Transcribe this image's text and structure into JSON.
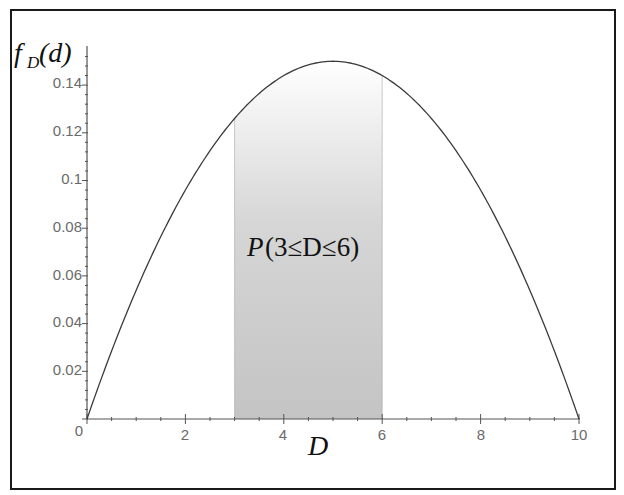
{
  "chart_data": {
    "type": "line",
    "title": "",
    "function": "f_D(d) = 0.006 d (10 - d)",
    "xlabel": "D",
    "ylabel": "f_D(d)",
    "xlim": [
      0,
      10
    ],
    "ylim": [
      0,
      0.15
    ],
    "grid": false,
    "legend": null,
    "x_ticks": [
      0,
      2,
      4,
      6,
      8,
      10
    ],
    "x_tick_labels": [
      "0",
      "2",
      "4",
      "6",
      "8",
      "10"
    ],
    "y_ticks": [
      0,
      0.02,
      0.04,
      0.06,
      0.08,
      0.1,
      0.12,
      0.14
    ],
    "y_tick_labels": [
      "0",
      "0.02",
      "0.04",
      "0.06",
      "0.08",
      "0.1",
      "0.12",
      "0.14"
    ],
    "series": [
      {
        "name": "f_D(d)",
        "x": [
          0,
          1,
          2,
          3,
          4,
          5,
          6,
          7,
          8,
          9,
          10
        ],
        "values": [
          0,
          0.054,
          0.096,
          0.126,
          0.144,
          0.15,
          0.144,
          0.126,
          0.096,
          0.054,
          0
        ]
      }
    ],
    "shaded_region": {
      "from": 3,
      "to": 6,
      "fill": "gradient white-to-grey"
    },
    "annotations": [
      {
        "text": "P(3≤D≤6)",
        "x": 4.5,
        "y": 0.07
      }
    ]
  },
  "labels": {
    "y_axis_f": "f",
    "y_axis_sub": "D",
    "y_axis_arg": "(d)",
    "x_axis": "D",
    "annotation_P": "P",
    "annotation_body": "(3≤D≤6)",
    "x_ticks": [
      "0",
      "2",
      "4",
      "6",
      "8",
      "10"
    ],
    "y_ticks": [
      "0.02",
      "0.04",
      "0.06",
      "0.08",
      "0.1",
      "0.12",
      "0.14"
    ]
  },
  "colors": {
    "curve": "#3a3a3a",
    "axis": "#555555",
    "shade_top": "#ffffff",
    "shade_bottom": "#c4c4c4",
    "frame": "#1a1a1a"
  }
}
